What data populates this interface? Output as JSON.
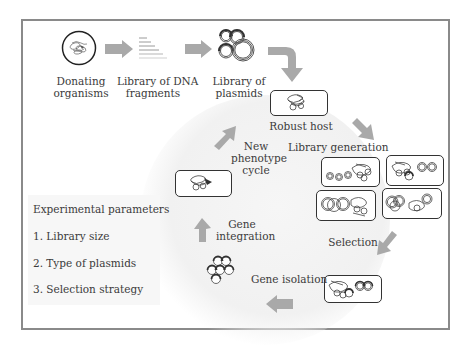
{
  "diagram": {
    "type": "workflow-cycle",
    "top_flow": [
      {
        "id": "donating-organisms",
        "label_line1": "Donating",
        "label_line2": "organisms"
      },
      {
        "id": "dna-fragment-library",
        "label_line1": "Library of DNA",
        "label_line2": "fragments"
      },
      {
        "id": "plasmid-library",
        "label_line1": "Library of",
        "label_line2": "plasmids"
      }
    ],
    "cycle_steps": {
      "robust_host": "Robust host",
      "library_generation": "Library generation",
      "selection": "Selection",
      "gene_isolation": "Gene isolation",
      "gene_integration_line1": "Gene",
      "gene_integration_line2": "integration",
      "new_phenotype_line1": "New",
      "new_phenotype_line2": "phenotype",
      "new_phenotype_line3": "cycle"
    },
    "parameters": {
      "title": "Experimental parameters",
      "items": [
        "1. Library size",
        "2. Type of plasmids",
        "3. Selection strategy"
      ]
    },
    "colors": {
      "arrow": "#a9a9a9",
      "frame": "#8a8a8a",
      "box_border": "#333333",
      "text": "#3b3b3b"
    }
  }
}
